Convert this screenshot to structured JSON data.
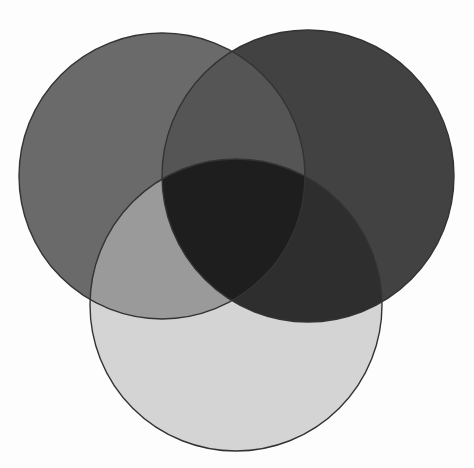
{
  "diagram": {
    "type": "venn",
    "set_count": 3,
    "background": "#fdfdfd",
    "outline_color": "#333333",
    "outline_width": 1.4,
    "sets": [
      {
        "id": "A",
        "position": "top-left",
        "cx": 162,
        "cy": 176,
        "r": 143
      },
      {
        "id": "B",
        "position": "top-right",
        "cx": 308,
        "cy": 176,
        "r": 146
      },
      {
        "id": "C",
        "position": "bottom",
        "cx": 236,
        "cy": 305,
        "r": 146
      }
    ],
    "region_colors": {
      "A_only": "#6a6a6a",
      "B_only": "#424242",
      "C_only": "#d4d4d4",
      "A_and_B": "#555555",
      "A_and_C": "#9a9a9a",
      "B_and_C": "#2e2e2e",
      "A_and_B_and_C": "#1e1e1e"
    },
    "labels": []
  }
}
